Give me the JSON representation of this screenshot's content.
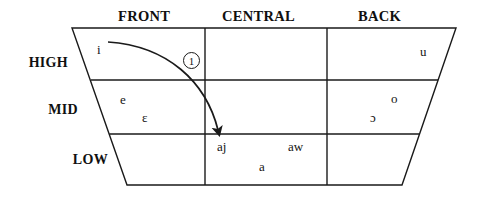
{
  "diagram": {
    "type": "vowel-trapezoid",
    "line_color": "#1a1a1a",
    "text_color": "#141414",
    "background": "#ffffff"
  },
  "columns": [
    {
      "id": "front",
      "label": "FRONT"
    },
    {
      "id": "central",
      "label": "CENTRAL"
    },
    {
      "id": "back",
      "label": "BACK"
    }
  ],
  "rows": [
    {
      "id": "high",
      "label": "HIGH"
    },
    {
      "id": "mid",
      "label": "MID"
    },
    {
      "id": "low",
      "label": "LOW"
    }
  ],
  "vowels": [
    {
      "symbol": "i",
      "row": "high",
      "column": "front",
      "x": 97,
      "y": 50
    },
    {
      "symbol": "u",
      "row": "high",
      "column": "back",
      "x": 420,
      "y": 52
    },
    {
      "symbol": "e",
      "row": "mid",
      "column": "front",
      "x": 120,
      "y": 100
    },
    {
      "symbol": "ɛ",
      "row": "mid",
      "column": "front",
      "x": 142,
      "y": 118
    },
    {
      "symbol": "o",
      "row": "mid",
      "column": "back",
      "x": 391,
      "y": 99
    },
    {
      "symbol": "ɔ",
      "row": "mid",
      "column": "back",
      "x": 370,
      "y": 118
    },
    {
      "symbol": "aj",
      "row": "low",
      "column": "central",
      "x": 217,
      "y": 147
    },
    {
      "symbol": "aw",
      "row": "low",
      "column": "central",
      "x": 288,
      "y": 147
    },
    {
      "symbol": "a",
      "row": "low",
      "column": "central",
      "x": 259,
      "y": 167
    }
  ],
  "annotations": [
    {
      "id": "marker-1",
      "label": "1",
      "shape": "circled-number",
      "x": 183,
      "y": 55,
      "describes": "diphthong glide arrow from i to aj"
    }
  ],
  "arrows": [
    {
      "id": "glide-arrow",
      "from_symbol": "i",
      "to_symbol": "aj",
      "start": {
        "x": 108,
        "y": 42
      },
      "control1": {
        "x": 168,
        "y": 46
      },
      "control2": {
        "x": 206,
        "y": 82
      },
      "end": {
        "x": 218,
        "y": 131
      },
      "arrowhead": "filled-triangle"
    }
  ],
  "geometry": {
    "top_y": 28,
    "bottom_y": 185,
    "row_line_high_mid_y": 80,
    "row_line_mid_low_y": 134,
    "top_left_x": 72,
    "top_right_x": 456,
    "bottom_left_x": 127,
    "bottom_right_x": 402,
    "divider_1_x": 205,
    "divider_2_x": 327
  }
}
